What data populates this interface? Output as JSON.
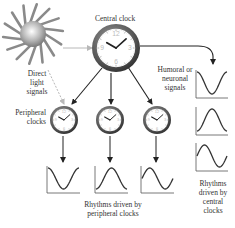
{
  "diagram": {
    "labels": {
      "central_clock": "Central clock",
      "direct_light_line1": "Direct",
      "direct_light_line2": "light",
      "direct_light_line3": "signals",
      "humoral_line1": "Humoral or",
      "humoral_line2": "neuronal",
      "humoral_line3": "signals",
      "peripheral_line1": "Peripheral",
      "peripheral_line2": "clocks",
      "rhythms_peripheral_line1": "Rhythms driven by",
      "rhythms_peripheral_line2": "peripheral clocks",
      "rhythms_central_line1": "Rhythms",
      "rhythms_central_line2": "driven by",
      "rhythms_central_line3": "central",
      "rhythms_central_line4": "clocks"
    },
    "nodes": [
      {
        "id": "sun",
        "icon": "sun-icon"
      },
      {
        "id": "central-clock",
        "icon": "clock-icon"
      },
      {
        "id": "peripheral-clock-1",
        "icon": "clock-icon"
      },
      {
        "id": "peripheral-clock-2",
        "icon": "clock-icon"
      },
      {
        "id": "peripheral-clock-3",
        "icon": "clock-icon"
      }
    ],
    "waveforms": {
      "peripheral": [
        {
          "name": "rhythm-peripheral-1",
          "phase": 0
        },
        {
          "name": "rhythm-peripheral-2",
          "phase": 0.5
        },
        {
          "name": "rhythm-peripheral-3",
          "phase": 0.75
        }
      ],
      "central": [
        {
          "name": "rhythm-central-1",
          "phase": 0
        },
        {
          "name": "rhythm-central-2",
          "phase": 0.5
        },
        {
          "name": "rhythm-central-3",
          "phase": 0.75
        }
      ]
    },
    "colors": {
      "arrow": "#222222",
      "light_arrow": "#b8b8b8",
      "clock_rim": "#5a5a5a",
      "clock_face": "#ffffff",
      "sun": "#8a8a8a",
      "wave": "#333333",
      "axis": "#555555"
    }
  }
}
